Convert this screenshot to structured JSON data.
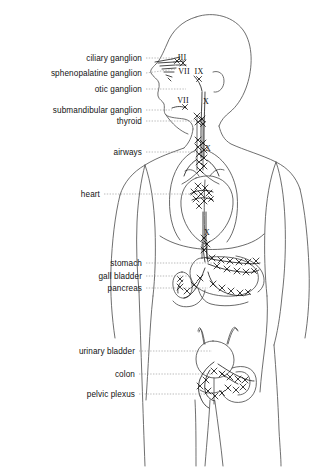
{
  "figure": {
    "ink_color": "#1a1a1a",
    "outline_color": "#555555",
    "leader_color": "#8a8a8a",
    "background": "#ffffff"
  },
  "organ_labels": [
    {
      "id": "ciliary-ganglion",
      "text": "ciliary ganglion",
      "text_x": 142,
      "text_y": 58,
      "line_x1": 146,
      "line_y1": 58,
      "line_x2": 176,
      "line_y2": 58
    },
    {
      "id": "sphenopalatine-ganglion",
      "text": "sphenopalatine ganglion",
      "text_x": 142,
      "text_y": 73,
      "line_x1": 146,
      "line_y1": 73,
      "line_x2": 176,
      "line_y2": 69
    },
    {
      "id": "otic-ganglion",
      "text": "otic ganglion",
      "text_x": 142,
      "text_y": 89,
      "line_x1": 146,
      "line_y1": 89,
      "line_x2": 186,
      "line_y2": 89
    },
    {
      "id": "submandibular-ganglion",
      "text": "submandibular ganglion",
      "text_x": 142,
      "text_y": 110,
      "line_x1": 146,
      "line_y1": 110,
      "line_x2": 172,
      "line_y2": 110
    },
    {
      "id": "thyroid",
      "text": "thyroid",
      "text_x": 142,
      "text_y": 121,
      "line_x1": 146,
      "line_y1": 121,
      "line_x2": 199,
      "line_y2": 121
    },
    {
      "id": "airways",
      "text": "airways",
      "text_x": 142,
      "text_y": 152,
      "line_x1": 146,
      "line_y1": 152,
      "line_x2": 203,
      "line_y2": 152
    },
    {
      "id": "heart",
      "text": "heart",
      "text_x": 100,
      "text_y": 194,
      "line_x1": 104,
      "line_y1": 194,
      "line_x2": 205,
      "line_y2": 194
    },
    {
      "id": "stomach",
      "text": "stomach",
      "text_x": 142,
      "text_y": 263,
      "line_x1": 146,
      "line_y1": 263,
      "line_x2": 215,
      "line_y2": 263
    },
    {
      "id": "gall-bladder",
      "text": "gall bladder",
      "text_x": 142,
      "text_y": 276,
      "line_x1": 146,
      "line_y1": 276,
      "line_x2": 190,
      "line_y2": 276
    },
    {
      "id": "pancreas",
      "text": "pancreas",
      "text_x": 142,
      "text_y": 288,
      "line_x1": 146,
      "line_y1": 288,
      "line_x2": 208,
      "line_y2": 288
    },
    {
      "id": "urinary-bladder",
      "text": "urinary bladder",
      "text_x": 135,
      "text_y": 351,
      "line_x1": 139,
      "line_y1": 351,
      "line_x2": 212,
      "line_y2": 351
    },
    {
      "id": "colon",
      "text": "colon",
      "text_x": 135,
      "text_y": 374,
      "line_x1": 139,
      "line_y1": 374,
      "line_x2": 213,
      "line_y2": 374
    },
    {
      "id": "pelvic-plexus",
      "text": "pelvic plexus",
      "text_x": 135,
      "text_y": 394,
      "line_x1": 139,
      "line_y1": 394,
      "line_x2": 209,
      "line_y2": 394
    }
  ],
  "nerve_labels": [
    {
      "id": "cn-iii",
      "text": "III",
      "x": 182,
      "y": 57
    },
    {
      "id": "cn-vii-upper",
      "text": "VII",
      "x": 184,
      "y": 71
    },
    {
      "id": "cn-ix",
      "text": "IX",
      "x": 199,
      "y": 71
    },
    {
      "id": "cn-vii-lower",
      "text": "VII",
      "x": 183,
      "y": 100
    },
    {
      "id": "cn-x-neck",
      "text": "X",
      "x": 206,
      "y": 101
    },
    {
      "id": "cn-x-thorax",
      "text": "X",
      "x": 208,
      "y": 148
    },
    {
      "id": "cn-x-abdomen",
      "text": "X",
      "x": 207,
      "y": 232
    }
  ]
}
